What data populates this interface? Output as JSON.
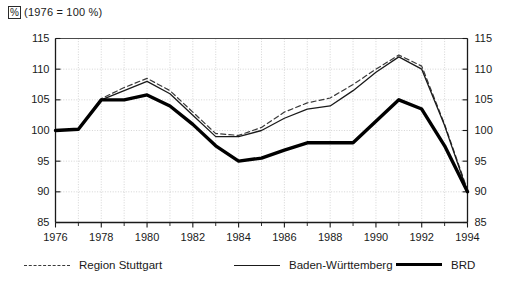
{
  "header": {
    "unit_symbol": "%",
    "base_note": "(1976 = 100 %)"
  },
  "legend": [
    {
      "label": "Region Stuttgart",
      "style": "dashed",
      "color": "#3a3a3a"
    },
    {
      "label": "Baden-Württemberg",
      "style": "solid",
      "color": "#1a1a1a"
    },
    {
      "label": "BRD",
      "style": "thick",
      "color": "#000000"
    }
  ],
  "chart_data": {
    "type": "line",
    "title": "",
    "subtitle": "",
    "xlabel": "",
    "ylabel": "%",
    "annotations": [
      "(1976 = 100 %)"
    ],
    "grid": true,
    "legend_position": "bottom",
    "xlim": [
      1976,
      1994
    ],
    "ylim": [
      85,
      115
    ],
    "yticks": [
      85,
      90,
      95,
      100,
      105,
      110,
      115
    ],
    "xticks": [
      1976,
      1978,
      1980,
      1982,
      1984,
      1986,
      1988,
      1990,
      1992,
      1994
    ],
    "x": [
      1976,
      1977,
      1978,
      1979,
      1980,
      1981,
      1982,
      1983,
      1984,
      1985,
      1986,
      1987,
      1988,
      1989,
      1990,
      1991,
      1992,
      1993,
      1994
    ],
    "series": [
      {
        "name": "Region Stuttgart",
        "style": "dashed",
        "values": [
          100,
          100.2,
          105.2,
          107.0,
          108.5,
          106.5,
          103.0,
          99.5,
          99.2,
          100.5,
          103.0,
          104.5,
          105.3,
          107.5,
          110.0,
          112.3,
          110.5,
          101.0,
          90.3
        ]
      },
      {
        "name": "Baden-Württemberg",
        "style": "solid",
        "values": [
          100,
          100.2,
          105.0,
          106.5,
          108.0,
          106.0,
          102.5,
          99.0,
          99.0,
          100.0,
          102.0,
          103.5,
          104.0,
          106.5,
          109.5,
          112.0,
          110.0,
          100.8,
          90.0
        ]
      },
      {
        "name": "BRD",
        "style": "thick",
        "values": [
          100,
          100.2,
          105.0,
          105.0,
          105.8,
          104.0,
          101.0,
          97.5,
          95.0,
          95.5,
          96.8,
          98.0,
          98.0,
          98.0,
          101.5,
          105.0,
          103.5,
          97.5,
          90.0
        ]
      }
    ]
  }
}
